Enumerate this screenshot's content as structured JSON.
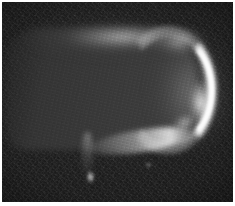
{
  "image": {
    "title": "Grayscale luminous arc plate",
    "type": "monochrome-photographic-plate",
    "width": 235,
    "height": 206,
    "colors": {
      "paper_border": "#ffffff",
      "sky_background": "#0b0b0b",
      "body_gray": "#3a3a3a",
      "glow_gray": "#9a9a9a",
      "arc_highlight": "#ffffff"
    },
    "border": {
      "style": "thin white margin",
      "thickness_px": 2
    },
    "features": [
      {
        "name": "sky-field",
        "label": "Dark grainy background field",
        "region": "full frame",
        "brightness": "very low"
      },
      {
        "name": "luminous-body",
        "label": "Broad rounded luminous slab",
        "region": "left-of-centre to centre-right",
        "brightness": "low-medium"
      },
      {
        "name": "top-glow-band",
        "label": "Diffuse horizontal glow band along upper edge",
        "region": "upper centre",
        "brightness": "medium"
      },
      {
        "name": "bright-arc",
        "label": "Brilliant crescent arc along right limb",
        "region": "right side",
        "brightness": "maximum"
      },
      {
        "name": "lower-ridge",
        "label": "Bright diagonal ridge at lower boundary",
        "region": "lower centre-right",
        "brightness": "high"
      },
      {
        "name": "plume-streak",
        "label": "Faint vertical plume descending below body",
        "region": "lower left-of-centre",
        "brightness": "low"
      },
      {
        "name": "plume-knot",
        "label": "Compact bright knot at base of plume",
        "region": "lower left-of-centre",
        "brightness": "high"
      }
    ]
  }
}
